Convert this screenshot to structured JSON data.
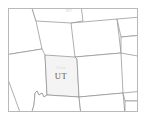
{
  "thumbnail": {
    "title": "Mountain West states reference map",
    "frame_color": "#b9b9b9",
    "background_color": "#ffffff",
    "boundary_color": "#8c8c8c",
    "selected_fill_color": "#f4f4f4"
  },
  "map": {
    "selected_state_label": "UT",
    "selected_state_sublabel": "Utah",
    "top_edge_label": "MT",
    "states": [
      {
        "code": "ID",
        "name": "Idaho"
      },
      {
        "code": "MT",
        "name": "Montana"
      },
      {
        "code": "WY",
        "name": "Wyoming"
      },
      {
        "code": "NV",
        "name": "Nevada"
      },
      {
        "code": "UT",
        "name": "Utah"
      },
      {
        "code": "CO",
        "name": "Colorado"
      },
      {
        "code": "AZ",
        "name": "Arizona"
      },
      {
        "code": "NM",
        "name": "New Mexico"
      },
      {
        "code": "NE",
        "name": "Nebraska"
      },
      {
        "code": "KS",
        "name": "Kansas"
      },
      {
        "code": "OK",
        "name": "Oklahoma"
      }
    ]
  }
}
